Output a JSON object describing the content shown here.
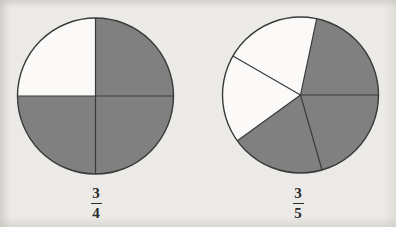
{
  "page": {
    "background_color": "#eceae6"
  },
  "style": {
    "shaded_color": "#808080",
    "unshaded_color": "#fbfaf8",
    "outline_color": "#3a3a3a",
    "divider_color": "#3a3a3a",
    "label_color": "#2b2b2b"
  },
  "figures": [
    {
      "id": "figure-left",
      "name": "three-fourths-circle",
      "center": {
        "x": 95.5,
        "y": 96
      },
      "radius": 78,
      "total_parts": 4,
      "shaded_parts": 3,
      "label": {
        "numerator": "3",
        "denominator": "4",
        "text": "3/4"
      },
      "sectors": [
        {
          "index": 0,
          "start_deg": 0,
          "end_deg": 90,
          "shaded": true,
          "position": "top-right"
        },
        {
          "index": 1,
          "start_deg": 90,
          "end_deg": 180,
          "shaded": false,
          "position": "top-left"
        },
        {
          "index": 2,
          "start_deg": 180,
          "end_deg": 270,
          "shaded": true,
          "position": "bottom-left"
        },
        {
          "index": 3,
          "start_deg": 270,
          "end_deg": 360,
          "shaded": true,
          "position": "bottom-right"
        }
      ]
    },
    {
      "id": "figure-right",
      "name": "three-fifths-circle",
      "center": {
        "x": 300.5,
        "y": 95
      },
      "radius": 78,
      "total_parts": 5,
      "shaded_parts": 3,
      "label": {
        "numerator": "3",
        "denominator": "5",
        "text": "3/5"
      },
      "sectors": [
        {
          "index": 0,
          "start_deg": 0,
          "end_deg": 78,
          "shaded": true,
          "position": "right-upper"
        },
        {
          "index": 1,
          "start_deg": 78,
          "end_deg": 150,
          "shaded": false,
          "position": "top-left"
        },
        {
          "index": 2,
          "start_deg": 150,
          "end_deg": 216,
          "shaded": false,
          "position": "left"
        },
        {
          "index": 3,
          "start_deg": 216,
          "end_deg": 286,
          "shaded": true,
          "position": "bottom-left"
        },
        {
          "index": 4,
          "start_deg": 286,
          "end_deg": 360,
          "shaded": true,
          "position": "bottom-right"
        }
      ]
    }
  ]
}
